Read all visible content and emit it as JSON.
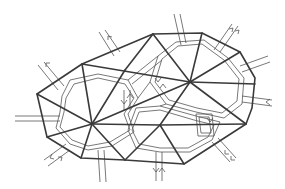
{
  "diagram": {
    "colors": {
      "mesh": "#3a3a3a",
      "dual": "#555555",
      "background": "#ffffff"
    },
    "vertices": {
      "A": [
        37,
        94
      ],
      "B": [
        82,
        64
      ],
      "C": [
        153,
        34
      ],
      "D": [
        202,
        33
      ],
      "E": [
        240,
        52
      ],
      "F": [
        255,
        78
      ],
      "G": [
        252,
        108
      ],
      "H": [
        246,
        124
      ],
      "I": [
        184,
        164
      ],
      "J": [
        125,
        160
      ],
      "K": [
        81,
        158
      ],
      "L": [
        47,
        137
      ],
      "P": [
        190,
        82
      ],
      "Q": [
        92,
        124
      ],
      "R": [
        160,
        125
      ]
    },
    "boundary": [
      "A",
      "B",
      "C",
      "D",
      "E",
      "F",
      "G",
      "H",
      "I",
      "J",
      "K",
      "L"
    ],
    "edges": [
      [
        "B",
        "Q"
      ],
      [
        "B",
        "P"
      ],
      [
        "C",
        "P"
      ],
      [
        "D",
        "P"
      ],
      [
        "E",
        "P"
      ],
      [
        "F",
        "P"
      ],
      [
        "G",
        "P"
      ],
      [
        "P",
        "R"
      ],
      [
        "P",
        "Q"
      ],
      [
        "Q",
        "R"
      ],
      [
        "A",
        "Q"
      ],
      [
        "L",
        "Q"
      ],
      [
        "K",
        "Q"
      ],
      [
        "J",
        "Q"
      ],
      [
        "J",
        "R"
      ],
      [
        "I",
        "R"
      ],
      [
        "H",
        "R"
      ],
      [
        "G",
        "R"
      ],
      [
        "A",
        "L"
      ]
    ],
    "boundary_flows": [
      {
        "name": "flow-top-left-1",
        "x1": 40,
        "y1": 70,
        "x2": 55,
        "y2": 88,
        "dir": "out"
      },
      {
        "name": "flow-top-left-2",
        "x1": 100,
        "y1": 33,
        "x2": 115,
        "y2": 55,
        "dir": "out"
      },
      {
        "name": "flow-top-1",
        "x1": 174,
        "y1": 13,
        "x2": 180,
        "y2": 37,
        "dir": "in"
      },
      {
        "name": "flow-top-right",
        "x1": 230,
        "y1": 30,
        "x2": 217,
        "y2": 45,
        "dir": "out"
      },
      {
        "name": "flow-right-1",
        "x1": 268,
        "y1": 58,
        "x2": 245,
        "y2": 68,
        "dir": "in"
      },
      {
        "name": "flow-right-2",
        "x1": 270,
        "y1": 103,
        "x2": 250,
        "y2": 100,
        "dir": "in"
      },
      {
        "name": "flow-bottom-right",
        "x1": 232,
        "y1": 158,
        "x2": 220,
        "y2": 143,
        "dir": "in"
      },
      {
        "name": "flow-bottom",
        "x1": 157,
        "y1": 183,
        "x2": 157,
        "y2": 165,
        "dir": "out"
      },
      {
        "name": "flow-bottom-left",
        "x1": 100,
        "y1": 183,
        "x2": 98,
        "y2": 162,
        "dir": "none"
      },
      {
        "name": "flow-lower-left",
        "x1": 47,
        "y1": 165,
        "x2": 62,
        "y2": 152,
        "dir": "out"
      },
      {
        "name": "flow-left",
        "x1": 15,
        "y1": 118,
        "x2": 40,
        "y2": 118,
        "dir": "none"
      }
    ]
  }
}
